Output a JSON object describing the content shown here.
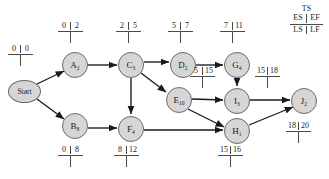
{
  "diagram": {
    "type": "project-network-pert-cpm",
    "legend": {
      "ts": "TS",
      "es": "ES",
      "ef": "EF",
      "ls": "LS",
      "lf": "LF"
    },
    "nodes": [
      {
        "id": "start",
        "label": "Start",
        "sub": "",
        "shape": "ellipse",
        "x": 8,
        "y": 80,
        "w": 33,
        "h": 23
      },
      {
        "id": "A",
        "label": "A",
        "sub": "2",
        "shape": "circle",
        "x": 62,
        "y": 52,
        "w": 26,
        "h": 26
      },
      {
        "id": "B",
        "label": "B",
        "sub": "8",
        "shape": "circle",
        "x": 62,
        "y": 113,
        "w": 26,
        "h": 26
      },
      {
        "id": "C",
        "label": "C",
        "sub": "3",
        "shape": "circle",
        "x": 118,
        "y": 52,
        "w": 26,
        "h": 26
      },
      {
        "id": "F",
        "label": "F",
        "sub": "4",
        "shape": "circle",
        "x": 118,
        "y": 116,
        "w": 26,
        "h": 26
      },
      {
        "id": "D",
        "label": "D",
        "sub": "2",
        "shape": "circle",
        "x": 170,
        "y": 52,
        "w": 26,
        "h": 26
      },
      {
        "id": "E",
        "label": "E",
        "sub": "10",
        "shape": "circle",
        "x": 166,
        "y": 87,
        "w": 26,
        "h": 26
      },
      {
        "id": "G",
        "label": "G",
        "sub": "4",
        "shape": "circle",
        "x": 224,
        "y": 52,
        "w": 26,
        "h": 26
      },
      {
        "id": "I",
        "label": "I",
        "sub": "3",
        "shape": "circle",
        "x": 224,
        "y": 88,
        "w": 26,
        "h": 26
      },
      {
        "id": "H",
        "label": "H",
        "sub": "1",
        "shape": "circle",
        "x": 224,
        "y": 118,
        "w": 26,
        "h": 26
      },
      {
        "id": "J",
        "label": "J",
        "sub": "2",
        "shape": "circle",
        "x": 291,
        "y": 88,
        "w": 26,
        "h": 26
      }
    ],
    "edges": [
      {
        "from": "start",
        "to": "A"
      },
      {
        "from": "start",
        "to": "B"
      },
      {
        "from": "A",
        "to": "C"
      },
      {
        "from": "C",
        "to": "D"
      },
      {
        "from": "C",
        "to": "E"
      },
      {
        "from": "C",
        "to": "F"
      },
      {
        "from": "B",
        "to": "F"
      },
      {
        "from": "D",
        "to": "G"
      },
      {
        "from": "G",
        "to": "I"
      },
      {
        "from": "E",
        "to": "I"
      },
      {
        "from": "E",
        "to": "H"
      },
      {
        "from": "F",
        "to": "H"
      },
      {
        "from": "I",
        "to": "J"
      },
      {
        "from": "H",
        "to": "J"
      }
    ],
    "time_labels": [
      {
        "id": "start-times",
        "node": "start",
        "left": "0",
        "right": "0",
        "position": "above",
        "x": 8,
        "y": 45
      },
      {
        "id": "A-times",
        "node": "A",
        "left": "0",
        "right": "2",
        "position": "above",
        "x": 58,
        "y": 22
      },
      {
        "id": "C-times",
        "node": "C",
        "left": "2",
        "right": "5",
        "position": "above",
        "x": 116,
        "y": 22
      },
      {
        "id": "D-times",
        "node": "D",
        "left": "5",
        "right": "7",
        "position": "above",
        "x": 168,
        "y": 22
      },
      {
        "id": "G-times",
        "node": "G",
        "left": "7",
        "right": "11",
        "position": "above",
        "x": 220,
        "y": 22
      },
      {
        "id": "E-times",
        "node": "E",
        "left": "5",
        "right": "15",
        "position": "above",
        "x": 190,
        "y": 67
      },
      {
        "id": "I-times",
        "node": "I",
        "left": "15",
        "right": "18",
        "position": "above",
        "x": 255,
        "y": 67
      },
      {
        "id": "B-times",
        "node": "B",
        "left": "0",
        "right": "8",
        "position": "below",
        "x": 58,
        "y": 144
      },
      {
        "id": "F-times",
        "node": "F",
        "left": "8",
        "right": "12",
        "position": "below",
        "x": 114,
        "y": 144
      },
      {
        "id": "H-times",
        "node": "H",
        "left": "15",
        "right": "16",
        "position": "below",
        "x": 218,
        "y": 144
      },
      {
        "id": "J-times",
        "node": "J",
        "left": "18",
        "right": "20",
        "position": "below",
        "x": 286,
        "y": 120
      }
    ],
    "colors": {
      "node_fill": "#d6d6d6",
      "node_stroke": "#6a6a6a",
      "edge": "#1a1a1a",
      "text": "#1a1a1a",
      "rule": "#4a4a4a",
      "background": "#ffffff"
    }
  }
}
